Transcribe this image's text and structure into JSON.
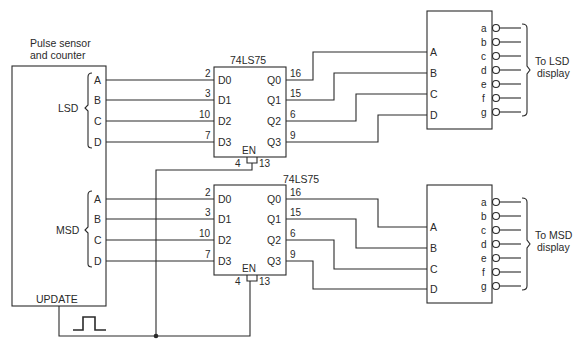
{
  "counter": {
    "title_line1": "Pulse sensor",
    "title_line2": "and counter",
    "lsd_label": "LSD",
    "msd_label": "MSD",
    "lsd_outputs": [
      "A",
      "B",
      "C",
      "D"
    ],
    "msd_outputs": [
      "A",
      "B",
      "C",
      "D"
    ],
    "update_label": "UPDATE"
  },
  "latch_top": {
    "part": "74LS75",
    "inputs": [
      "D0",
      "D1",
      "D2",
      "D3"
    ],
    "input_pins": [
      "2",
      "3",
      "10",
      "7"
    ],
    "outputs": [
      "Q0",
      "Q1",
      "Q2",
      "Q3"
    ],
    "output_pins": [
      "16",
      "15",
      "6",
      "9"
    ],
    "enable_label": "EN",
    "enable_pins": [
      "4",
      "13"
    ]
  },
  "latch_bottom": {
    "part": "74LS75",
    "inputs": [
      "D0",
      "D1",
      "D2",
      "D3"
    ],
    "input_pins": [
      "2",
      "3",
      "10",
      "7"
    ],
    "outputs": [
      "Q0",
      "Q1",
      "Q2",
      "Q3"
    ],
    "output_pins": [
      "16",
      "15",
      "6",
      "9"
    ],
    "enable_label": "EN",
    "enable_pins": [
      "4",
      "13"
    ]
  },
  "decoder_top": {
    "inputs": [
      "A",
      "B",
      "C",
      "D"
    ],
    "outputs": [
      "a",
      "b",
      "c",
      "d",
      "e",
      "f",
      "g"
    ],
    "dest_line1": "To LSD",
    "dest_line2": "display"
  },
  "decoder_bottom": {
    "inputs": [
      "A",
      "B",
      "C",
      "D"
    ],
    "outputs": [
      "a",
      "b",
      "c",
      "d",
      "e",
      "f",
      "g"
    ],
    "dest_line1": "To MSD",
    "dest_line2": "display"
  }
}
